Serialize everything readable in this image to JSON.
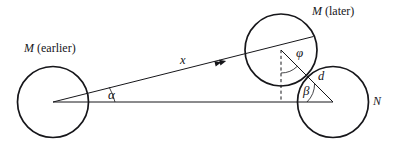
{
  "figure": {
    "kind": "geometry-diagram",
    "width": 399,
    "height": 147,
    "background_color": "#ffffff",
    "stroke_color": "#16161a",
    "text_color": "#16161a"
  },
  "labels": {
    "m_earlier_italic": "M",
    "m_earlier_rest": " (earlier)",
    "m_later_italic": "M",
    "m_later_rest": " (later)",
    "n": "N",
    "x": "x",
    "d": "d",
    "alpha": "α",
    "beta": "β",
    "phi": "φ"
  },
  "circles": [
    {
      "name": "m-earlier",
      "cx": 53,
      "cy": 102,
      "r": 35.5
    },
    {
      "name": "m-later",
      "cx": 281,
      "cy": 50,
      "r": 36
    },
    {
      "name": "n",
      "cx": 333,
      "cy": 102,
      "r": 35.5
    }
  ],
  "segments": [
    {
      "name": "x-line",
      "x1": 53,
      "y1": 102,
      "x2": 313,
      "y2": 36.5,
      "style": "solid"
    },
    {
      "name": "baseline",
      "x1": 53,
      "y1": 102,
      "x2": 333,
      "y2": 102,
      "style": "solid"
    },
    {
      "name": "d-line",
      "x1": 281,
      "y1": 50,
      "x2": 333,
      "y2": 102,
      "style": "solid"
    },
    {
      "name": "plumb-line",
      "x1": 281,
      "y1": 50,
      "x2": 281,
      "y2": 102,
      "style": "dashed"
    }
  ],
  "arcs": [
    {
      "name": "alpha-arc",
      "vertex": "m-earlier-center",
      "radius": 62
    },
    {
      "name": "beta-arc",
      "vertex": "n-center",
      "radius": 26
    },
    {
      "name": "phi-arc",
      "vertex": "m-later-center",
      "radius": 23
    }
  ],
  "markers": [
    {
      "name": "direction-arrowheads",
      "on": "x-line",
      "x": 221,
      "y": 62,
      "count": 2
    }
  ],
  "label_positions": {
    "m_earlier": {
      "x": 24,
      "y": 43
    },
    "m_later": {
      "x": 312,
      "y": 6
    },
    "n": {
      "x": 373,
      "y": 95
    },
    "x": {
      "x": 180,
      "y": 54
    },
    "d": {
      "x": 318,
      "y": 71
    },
    "alpha": {
      "x": 108,
      "y": 89
    },
    "beta": {
      "x": 303,
      "y": 85
    },
    "phi": {
      "x": 297,
      "y": 47
    }
  }
}
